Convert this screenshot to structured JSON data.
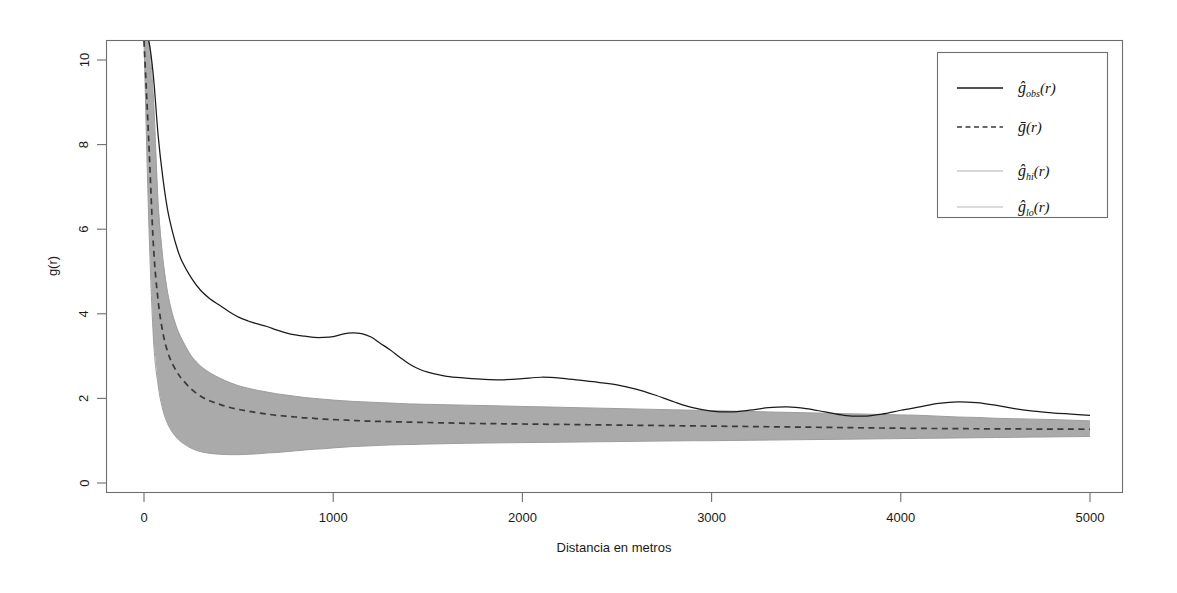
{
  "chart_data": {
    "type": "line",
    "title": "",
    "xlabel": "Distancia en metros",
    "ylabel": "g(r)",
    "xlim": [
      -180,
      5180
    ],
    "ylim": [
      -0.55,
      10.45
    ],
    "xticks": [
      0,
      1000,
      2000,
      3000,
      4000,
      5000
    ],
    "xtick_labels": [
      "0",
      "1000",
      "2000",
      "3000",
      "4000",
      "5000"
    ],
    "yticks": [
      0,
      2,
      4,
      6,
      8,
      10
    ],
    "ytick_labels": [
      "0",
      "2",
      "4",
      "6",
      "8",
      "10"
    ],
    "grid": false,
    "legend_position": "top-right",
    "legend_entries": [
      {
        "label": "ĝ_obs(r)",
        "style": "solid",
        "color": "#1a1a1a"
      },
      {
        "label": "ḡ(r)",
        "style": "dashed",
        "color": "#333333"
      },
      {
        "label": "ĝ_hi(r)",
        "style": "solid",
        "color": "#b8b8b8"
      },
      {
        "label": "ĝ_lo(r)",
        "style": "solid",
        "color": "#b8b8b8"
      }
    ],
    "envelope_fill_color": "#aaaaaa",
    "x": [
      0,
      25,
      50,
      75,
      100,
      125,
      150,
      175,
      200,
      250,
      300,
      350,
      400,
      450,
      500,
      550,
      600,
      650,
      700,
      750,
      800,
      850,
      900,
      950,
      1000,
      1050,
      1100,
      1150,
      1200,
      1250,
      1300,
      1350,
      1400,
      1450,
      1500,
      1600,
      1700,
      1800,
      1900,
      2000,
      2100,
      2200,
      2300,
      2400,
      2500,
      2600,
      2700,
      2800,
      2900,
      3000,
      3100,
      3200,
      3300,
      3400,
      3500,
      3600,
      3700,
      3800,
      3900,
      4000,
      4100,
      4200,
      4300,
      4400,
      4500,
      4600,
      4700,
      4800,
      4900,
      5000
    ],
    "series": [
      {
        "name": "ĝ_obs(r)",
        "style": "solid",
        "values": [
          10.45,
          10.45,
          9.6,
          8.2,
          7.2,
          6.45,
          5.95,
          5.55,
          5.25,
          4.85,
          4.55,
          4.35,
          4.2,
          4.05,
          3.92,
          3.83,
          3.76,
          3.7,
          3.62,
          3.55,
          3.5,
          3.47,
          3.44,
          3.44,
          3.46,
          3.52,
          3.55,
          3.53,
          3.45,
          3.3,
          3.15,
          2.98,
          2.82,
          2.7,
          2.62,
          2.52,
          2.48,
          2.45,
          2.44,
          2.47,
          2.5,
          2.48,
          2.43,
          2.38,
          2.32,
          2.22,
          2.08,
          1.92,
          1.78,
          1.7,
          1.68,
          1.72,
          1.78,
          1.8,
          1.76,
          1.68,
          1.6,
          1.58,
          1.63,
          1.72,
          1.8,
          1.88,
          1.92,
          1.9,
          1.84,
          1.76,
          1.7,
          1.66,
          1.63,
          1.6
        ]
      },
      {
        "name": "ḡ(r)",
        "style": "dashed",
        "values": [
          10.45,
          8.1,
          5.6,
          4.3,
          3.55,
          3.1,
          2.82,
          2.62,
          2.46,
          2.22,
          2.05,
          1.94,
          1.86,
          1.79,
          1.74,
          1.7,
          1.66,
          1.63,
          1.6,
          1.58,
          1.56,
          1.54,
          1.53,
          1.51,
          1.5,
          1.49,
          1.48,
          1.47,
          1.46,
          1.455,
          1.45,
          1.445,
          1.44,
          1.435,
          1.43,
          1.42,
          1.41,
          1.405,
          1.4,
          1.395,
          1.39,
          1.385,
          1.38,
          1.375,
          1.37,
          1.365,
          1.36,
          1.355,
          1.35,
          1.345,
          1.34,
          1.335,
          1.33,
          1.325,
          1.32,
          1.315,
          1.31,
          1.305,
          1.3,
          1.295,
          1.29,
          1.288,
          1.285,
          1.282,
          1.28,
          1.278,
          1.276,
          1.274,
          1.272,
          1.27
        ]
      },
      {
        "name": "ĝ_hi(r)",
        "style": "envelope-upper",
        "values": [
          10.45,
          10.45,
          9.1,
          6.6,
          5.3,
          4.5,
          4.0,
          3.65,
          3.4,
          3.0,
          2.76,
          2.6,
          2.48,
          2.38,
          2.3,
          2.24,
          2.19,
          2.15,
          2.11,
          2.08,
          2.05,
          2.02,
          2.0,
          1.98,
          1.96,
          1.945,
          1.93,
          1.92,
          1.91,
          1.9,
          1.89,
          1.88,
          1.87,
          1.865,
          1.86,
          1.85,
          1.84,
          1.83,
          1.82,
          1.81,
          1.8,
          1.79,
          1.78,
          1.77,
          1.76,
          1.75,
          1.74,
          1.73,
          1.72,
          1.71,
          1.7,
          1.69,
          1.68,
          1.67,
          1.66,
          1.65,
          1.64,
          1.63,
          1.62,
          1.61,
          1.6,
          1.58,
          1.56,
          1.55,
          1.53,
          1.52,
          1.51,
          1.5,
          1.485,
          1.47
        ]
      },
      {
        "name": "ĝ_lo(r)",
        "style": "envelope-lower",
        "values": [
          10.45,
          6.2,
          3.4,
          2.3,
          1.72,
          1.4,
          1.2,
          1.06,
          0.96,
          0.82,
          0.74,
          0.7,
          0.68,
          0.67,
          0.67,
          0.68,
          0.69,
          0.71,
          0.72,
          0.74,
          0.76,
          0.78,
          0.8,
          0.81,
          0.83,
          0.845,
          0.86,
          0.87,
          0.88,
          0.89,
          0.9,
          0.905,
          0.91,
          0.915,
          0.92,
          0.93,
          0.94,
          0.945,
          0.95,
          0.955,
          0.96,
          0.965,
          0.97,
          0.975,
          0.98,
          0.985,
          0.99,
          0.995,
          1.0,
          1.0,
          1.005,
          1.01,
          1.015,
          1.02,
          1.025,
          1.03,
          1.035,
          1.04,
          1.045,
          1.05,
          1.055,
          1.06,
          1.065,
          1.07,
          1.075,
          1.08,
          1.085,
          1.09,
          1.095,
          1.1
        ]
      }
    ]
  },
  "legend": {
    "items": [
      {
        "label": "(r)",
        "sym": "ĝ",
        "sub": "obs"
      },
      {
        "label": "(r)",
        "sym": "ḡ",
        "sub": ""
      },
      {
        "label": "(r)",
        "sym": "ĝ",
        "sub": "hi"
      },
      {
        "label": "(r)",
        "sym": "ĝ",
        "sub": "lo"
      }
    ]
  },
  "axes": {
    "xlabel": "Distancia en metros",
    "ylabel": "g(r)",
    "xtick_labels": [
      "0",
      "1000",
      "2000",
      "3000",
      "4000",
      "5000"
    ],
    "ytick_labels": [
      "0",
      "2",
      "4",
      "6",
      "8",
      "10"
    ]
  }
}
